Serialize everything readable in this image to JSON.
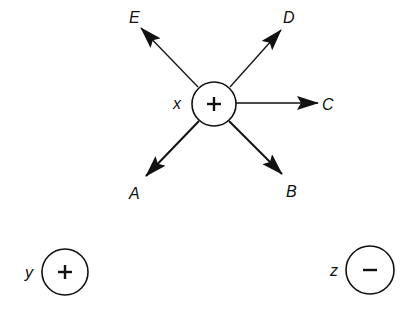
{
  "diagram": {
    "colors": {
      "stroke": "#111111",
      "background": "#ffffff"
    },
    "charges": [
      {
        "id": "x",
        "label": "x",
        "sign": "+",
        "cx": 214,
        "cy": 104,
        "r": 22,
        "label_x": 173,
        "label_y": 109
      },
      {
        "id": "y",
        "label": "y",
        "sign": "+",
        "cx": 65,
        "cy": 272,
        "r": 23,
        "label_x": 25,
        "label_y": 278
      },
      {
        "id": "z",
        "label": "z",
        "sign": "−",
        "cx": 370,
        "cy": 270,
        "r": 24,
        "label_x": 330,
        "label_y": 276
      }
    ],
    "arrows": [
      {
        "id": "A",
        "label": "A",
        "x1": 199,
        "y1": 121,
        "x2": 146,
        "y2": 176,
        "label_x": 129,
        "label_y": 199
      },
      {
        "id": "B",
        "label": "B",
        "x1": 229,
        "y1": 121,
        "x2": 282,
        "y2": 174,
        "label_x": 286,
        "label_y": 197
      },
      {
        "id": "C",
        "label": "C",
        "x1": 236,
        "y1": 103,
        "x2": 318,
        "y2": 103,
        "label_x": 322,
        "label_y": 110
      },
      {
        "id": "D",
        "label": "D",
        "x1": 230,
        "y1": 87,
        "x2": 281,
        "y2": 30,
        "label_x": 283,
        "label_y": 23
      },
      {
        "id": "E",
        "label": "E",
        "x1": 198,
        "y1": 87,
        "x2": 141,
        "y2": 28,
        "label_x": 129,
        "label_y": 23
      }
    ]
  }
}
